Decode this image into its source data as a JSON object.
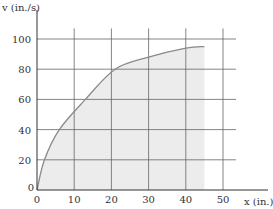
{
  "chart_data": {
    "type": "area",
    "title": "",
    "xlabel": "x (in.)",
    "ylabel": "v (in./s)",
    "xlim": [
      0,
      50
    ],
    "ylim": [
      0,
      100
    ],
    "xticks": [
      "0",
      "10",
      "20",
      "30",
      "40",
      "50"
    ],
    "yticks": [
      "0",
      "20",
      "40",
      "60",
      "80",
      "100"
    ],
    "grid": true,
    "legend": null,
    "series": [
      {
        "name": "v(x)",
        "x": [
          0,
          2,
          6,
          13,
          21,
          30,
          40,
          45
        ],
        "values": [
          0,
          20,
          40,
          60,
          80,
          88,
          94,
          95
        ]
      }
    ],
    "colors": {
      "curve": "#8a8a8a",
      "fill": "#ececec",
      "grid": "#555555",
      "axis": "#333333"
    }
  }
}
